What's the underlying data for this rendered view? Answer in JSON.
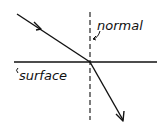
{
  "diagram": {
    "labels": {
      "normal": "normal",
      "surface": "surface"
    },
    "elements": {
      "surface_line": {
        "x1": 14,
        "y1": 62,
        "x2": 157,
        "y2": 62
      },
      "normal_line": {
        "x1": 90,
        "y1": 12,
        "x2": 90,
        "y2": 120,
        "style": "dashed"
      },
      "incident_ray": {
        "x1": 17,
        "y1": 14,
        "x2": 90,
        "y2": 62
      },
      "refracted_ray": {
        "x1": 90,
        "y1": 62,
        "x2": 123,
        "y2": 120
      }
    },
    "colors": {
      "ink": "#111111",
      "background": "#ffffff"
    }
  }
}
